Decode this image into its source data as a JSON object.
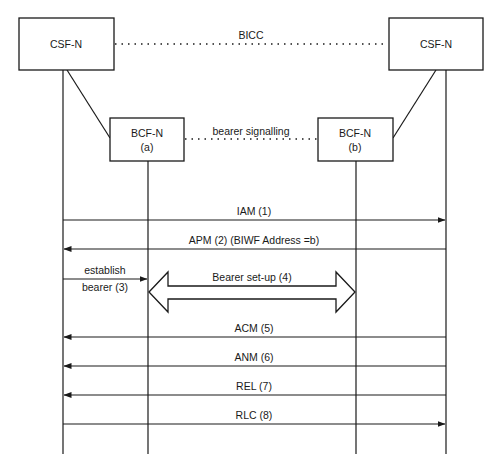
{
  "diagram": {
    "type": "sequence",
    "entities": [
      {
        "id": "csf_a",
        "label": "CSF-N"
      },
      {
        "id": "bcf_a",
        "label": "BCF-N",
        "sub": "(a)"
      },
      {
        "id": "bcf_b",
        "label": "BCF-N",
        "sub": "(b)"
      },
      {
        "id": "csf_b",
        "label": "CSF-N"
      }
    ],
    "links": {
      "bicc": "BICC",
      "bearer_signalling": "bearer signalling"
    },
    "messages": [
      {
        "label": "IAM (1)",
        "from": "csf_a",
        "to": "csf_b"
      },
      {
        "label": "APM (2) (BIWF Address =b)",
        "from": "csf_b",
        "to": "csf_a"
      },
      {
        "label_line1": "establish",
        "label_line2": "bearer (3)",
        "from": "csf_a",
        "to": "bcf_a"
      },
      {
        "label": "Bearer set-up (4)",
        "from": "bcf_a",
        "to": "bcf_b",
        "style": "double-block-arrow"
      },
      {
        "label": "ACM (5)",
        "from": "csf_b",
        "to": "csf_a"
      },
      {
        "label": "ANM (6)",
        "from": "csf_b",
        "to": "csf_a"
      },
      {
        "label": "REL (7)",
        "from": "csf_b",
        "to": "csf_a"
      },
      {
        "label": "RLC (8)",
        "from": "csf_a",
        "to": "csf_b"
      }
    ]
  }
}
